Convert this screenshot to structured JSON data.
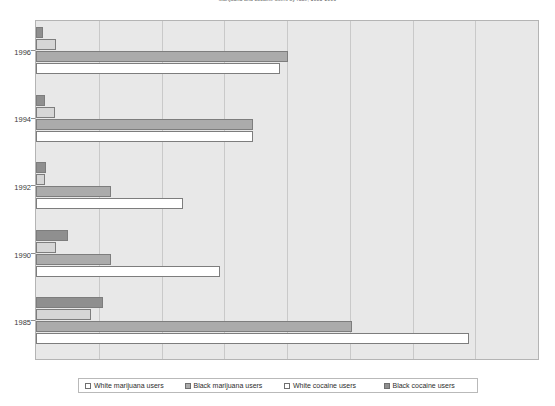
{
  "chart_data": {
    "type": "bar",
    "orientation": "horizontal",
    "title": "Marijuana and cocaine users by race, 1985-1996",
    "xlabel": "",
    "ylabel": "",
    "categories": [
      "1996",
      "1994",
      "1992",
      "1990",
      "1985"
    ],
    "grid": true,
    "gridlines": 7,
    "xlim": [
      0,
      700
    ],
    "legend_position": "bottom",
    "series": [
      {
        "name": "Black cocaine users",
        "color": "#8f8f8f",
        "values": [
          10,
          12,
          14,
          45,
          93
        ]
      },
      {
        "name": "White cocaine users",
        "color": "#d6d6d6",
        "values": [
          28,
          26,
          12,
          28,
          76
        ]
      },
      {
        "name": "Black marijuana users",
        "color": "#ababab",
        "values": [
          352,
          303,
          104,
          105,
          440
        ]
      },
      {
        "name": "White marijuana users",
        "color": "#ffffff",
        "values": [
          340,
          303,
          205,
          257,
          604
        ]
      }
    ]
  },
  "axis": {
    "y_ticks": [
      "1996",
      "1994",
      "1992",
      "1990",
      "1985"
    ]
  },
  "legend": {
    "items": [
      {
        "label": "White marijuana users",
        "color": "#ffffff"
      },
      {
        "label": "Black marijuana users",
        "color": "#ababab"
      },
      {
        "label": "White cocaine users",
        "color": "#ffffff"
      },
      {
        "label": "Black cocaine users",
        "color": "#8f8f8f"
      }
    ]
  }
}
